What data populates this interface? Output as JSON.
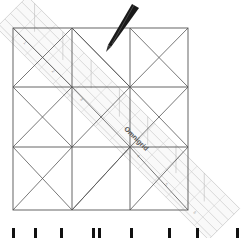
{
  "figure": {
    "grid": {
      "rows": 3,
      "cols": 3,
      "left": 13,
      "top": 28,
      "right": 188,
      "bottom": 210,
      "line_color": "#555555"
    },
    "ruler": {
      "label": "Omnigrid",
      "color": "#c9c9c9",
      "angle_deg": 45
    },
    "pen": {
      "color": "#1a1a1a"
    },
    "caption_partial": "cut-off caption text (only tops of letters visible)"
  }
}
